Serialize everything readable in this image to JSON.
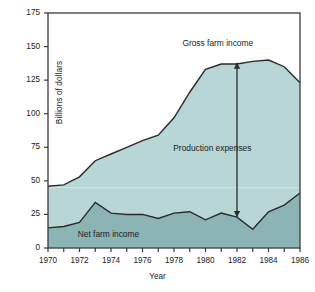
{
  "chart_data": {
    "type": "area",
    "title": "",
    "xlabel": "Year",
    "ylabel": "Billions of dollars",
    "xlim": [
      1970,
      1986
    ],
    "ylim": [
      0,
      175
    ],
    "ytick_values": [
      0,
      25,
      50,
      75,
      100,
      125,
      150,
      175
    ],
    "ytick_labels": [
      "0",
      "25",
      "50",
      "75",
      "100",
      "125",
      "150",
      "175"
    ],
    "xtick_values": [
      1970,
      1971,
      1972,
      1973,
      1974,
      1975,
      1976,
      1977,
      1978,
      1979,
      1980,
      1981,
      1982,
      1983,
      1984,
      1985,
      1986
    ],
    "xtick_labels_shown": [
      "1970",
      "1972",
      "1974",
      "1976",
      "1978",
      "1980",
      "1982",
      "1984",
      "1986"
    ],
    "grid": false,
    "stacked": true,
    "x": [
      1970,
      1971,
      1972,
      1973,
      1974,
      1975,
      1976,
      1977,
      1978,
      1979,
      1980,
      1981,
      1982,
      1983,
      1984,
      1985,
      1986
    ],
    "series": [
      {
        "name": "Gross farm income",
        "color": "#b9d6d6",
        "values": [
          46,
          47,
          53,
          65,
          70,
          75,
          80,
          84,
          97,
          116,
          133,
          137,
          137,
          139,
          140,
          135,
          123
        ]
      },
      {
        "name": "Net farm income",
        "color": "#8cb4b4",
        "values": [
          15,
          16,
          19,
          34,
          26,
          25,
          25,
          22,
          26,
          27,
          21,
          26,
          23,
          14,
          27,
          32,
          41
        ]
      }
    ],
    "annotations": [
      {
        "text": "Gross farm income",
        "x": 1981.2,
        "y": 152
      },
      {
        "text": "Production expenses",
        "x": 1981.0,
        "y": 74
      },
      {
        "text": "Net farm income",
        "x": 1974.3,
        "y": 10
      },
      {
        "text": "arrow-production-expenses",
        "x": 1982,
        "y_top": 138,
        "y_bottom": 23
      }
    ]
  },
  "colors": {
    "gross_fill": "#b9d6d6",
    "net_fill": "#8cb4b4",
    "line": "#2a2a2a",
    "axis": "#3a3a3a",
    "text": "#1b1b1b",
    "faint_gridline": "#d3e4e4"
  }
}
